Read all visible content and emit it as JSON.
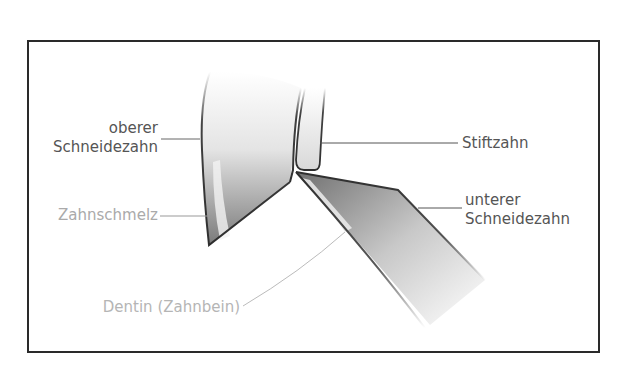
{
  "diagram": {
    "labels": {
      "upper_incisor_line1": "oberer",
      "upper_incisor_line2": "Schneidezahn",
      "enamel": "Zahnschmelz",
      "dentin": "Dentin (Zahnbein)",
      "pin_tooth": "Stiftzahn",
      "lower_incisor_line1": "unterer",
      "lower_incisor_line2": "Schneidezahn"
    },
    "colors": {
      "dark_label": "#555555",
      "light_label": "#b0b0b0",
      "outline": "#2e2e2e",
      "frame": "#2a2a2a"
    }
  }
}
